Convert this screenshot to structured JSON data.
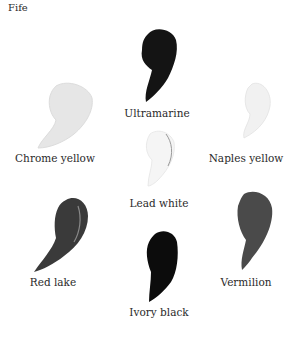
{
  "title": "Fife",
  "pigments": [
    {
      "name": "Ultramarine",
      "swatch_color": "#141414",
      "position": "top-center"
    },
    {
      "name": "Chrome yellow",
      "swatch_color": "#e6e6e6",
      "position": "upper-left"
    },
    {
      "name": "Naples yellow",
      "swatch_color": "#f0f0f0",
      "position": "upper-right"
    },
    {
      "name": "Lead white",
      "swatch_color": "#f4f4f4",
      "position": "center"
    },
    {
      "name": "Red lake",
      "swatch_color": "#3a3a3a",
      "position": "lower-left"
    },
    {
      "name": "Vermilion",
      "swatch_color": "#4a4a4a",
      "position": "lower-right"
    },
    {
      "name": "Ivory black",
      "swatch_color": "#0c0c0c",
      "position": "bottom-center"
    }
  ]
}
